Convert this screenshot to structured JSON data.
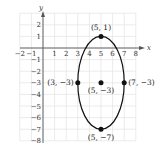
{
  "chart_data": {
    "type": "scatter",
    "title": "",
    "xlabel": "x",
    "ylabel": "y",
    "xlim": [
      -2,
      8
    ],
    "ylim": [
      -8,
      3
    ],
    "grid": true,
    "x_ticks": [
      "-2",
      "-1",
      "1",
      "2",
      "3",
      "4",
      "5",
      "6",
      "7",
      "8"
    ],
    "y_ticks": [
      "2",
      "1",
      "-1",
      "-2",
      "-3",
      "-4",
      "-5",
      "-6",
      "-7",
      "-8"
    ],
    "curve": {
      "shape": "ellipse",
      "center": [
        5,
        -3
      ],
      "semi_axis_x": 2,
      "semi_axis_y": 4
    },
    "points": [
      {
        "x": 5,
        "y": 1,
        "label": "(5, 1)"
      },
      {
        "x": 3,
        "y": -3,
        "label": "(3, −3)"
      },
      {
        "x": 5,
        "y": -3,
        "label": "(5, −3)"
      },
      {
        "x": 7,
        "y": -3,
        "label": "(7, −3)"
      },
      {
        "x": 5,
        "y": -7,
        "label": "(5, −7)"
      }
    ]
  }
}
